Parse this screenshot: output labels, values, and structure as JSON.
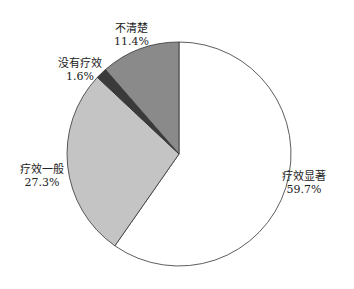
{
  "chart_data": {
    "type": "pie",
    "title": "",
    "start_angle": "12 o'clock",
    "direction": "clockwise",
    "slices": [
      {
        "label": "疗效显著",
        "value": 59.7,
        "value_label": "59.7%",
        "color": "#ffffff"
      },
      {
        "label": "疗效一般",
        "value": 27.3,
        "value_label": "27.3%",
        "color": "#c4c4c4"
      },
      {
        "label": "没有疗效",
        "value": 1.6,
        "value_label": "1.6%",
        "color": "#3a3a3a"
      },
      {
        "label": "不清楚",
        "value": 11.4,
        "value_label": "11.4%",
        "color": "#8a8a8a"
      }
    ]
  }
}
